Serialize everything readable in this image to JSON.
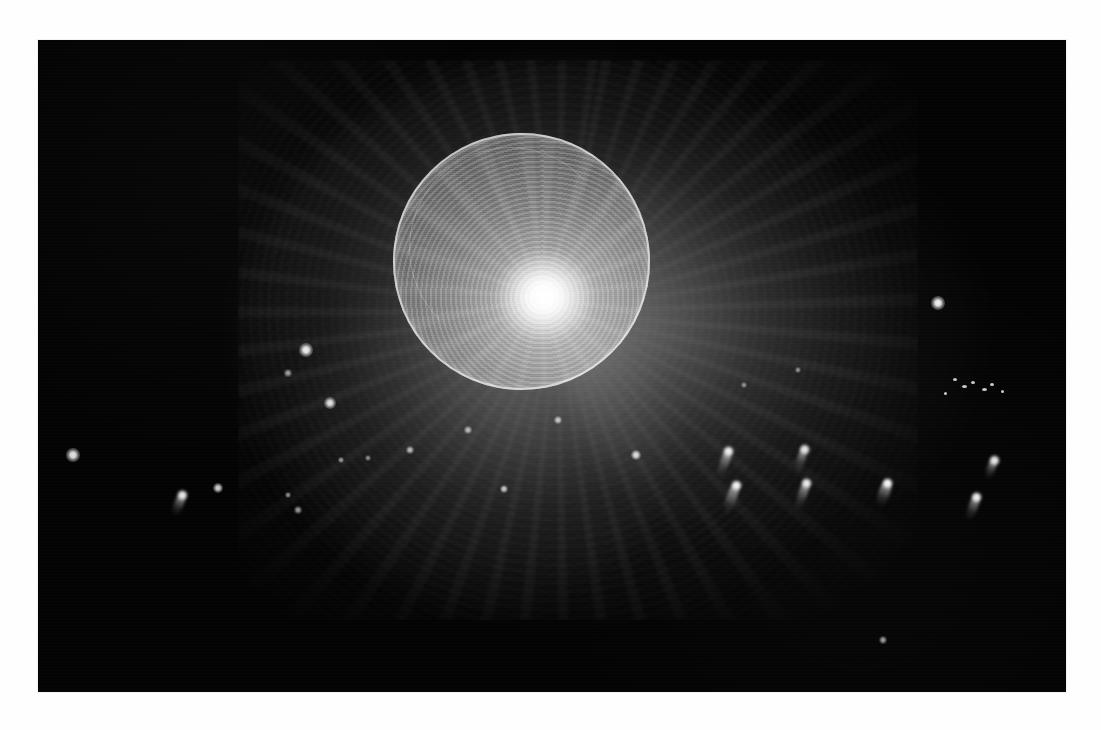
{
  "page": {
    "background_color": "#fefefe",
    "plate_background_color": "#030303",
    "caption": ""
  },
  "figure": {
    "title": "",
    "type": "grayscale-astronomical-plate",
    "plate": {
      "x": 38,
      "y": 40,
      "width": 1028,
      "height": 652
    }
  },
  "chart_data": {
    "type": "scatter",
    "title": "",
    "xlabel": "",
    "ylabel": "",
    "grid": false,
    "legend": "none",
    "xlim": [
      0,
      1028
    ],
    "ylim": [
      0,
      652
    ],
    "colors": {
      "background": "#030303",
      "source": "#ffffff",
      "halo": "#8c8c8c",
      "page": "#fefefe"
    },
    "sphere": {
      "center_x": 483,
      "center_y": 220,
      "radius": 128,
      "core_x": 467,
      "core_y": 218,
      "ring_count": 26,
      "peak_brightness": 255
    },
    "halo": {
      "center_x": 500,
      "center_y": 230,
      "radius_x": 330,
      "radius_y": 280,
      "mean_brightness": 58
    },
    "point_sources": [
      {
        "x": 35,
        "y": 415,
        "r": 3.0,
        "brightness": 230
      },
      {
        "x": 268,
        "y": 310,
        "r": 3.2,
        "brightness": 240
      },
      {
        "x": 250,
        "y": 333,
        "r": 1.6,
        "brightness": 150
      },
      {
        "x": 292,
        "y": 363,
        "r": 2.8,
        "brightness": 225
      },
      {
        "x": 180,
        "y": 448,
        "r": 2.2,
        "brightness": 210
      },
      {
        "x": 900,
        "y": 263,
        "r": 3.4,
        "brightness": 245
      },
      {
        "x": 303,
        "y": 420,
        "r": 1.5,
        "brightness": 140
      },
      {
        "x": 260,
        "y": 470,
        "r": 1.6,
        "brightness": 145
      },
      {
        "x": 520,
        "y": 380,
        "r": 1.8,
        "brightness": 175
      },
      {
        "x": 430,
        "y": 390,
        "r": 1.6,
        "brightness": 165
      },
      {
        "x": 372,
        "y": 410,
        "r": 1.7,
        "brightness": 170
      },
      {
        "x": 598,
        "y": 415,
        "r": 2.4,
        "brightness": 215
      },
      {
        "x": 466,
        "y": 449,
        "r": 1.9,
        "brightness": 185
      },
      {
        "x": 250,
        "y": 455,
        "r": 1.5,
        "brightness": 135
      },
      {
        "x": 330,
        "y": 418,
        "r": 1.4,
        "brightness": 130
      },
      {
        "x": 845,
        "y": 600,
        "r": 1.8,
        "brightness": 150
      },
      {
        "x": 760,
        "y": 330,
        "r": 1.5,
        "brightness": 130
      },
      {
        "x": 706,
        "y": 345,
        "r": 1.4,
        "brightness": 125
      }
    ],
    "speck_cluster": [
      {
        "x": 915,
        "y": 338,
        "w": 4,
        "h": 3
      },
      {
        "x": 924,
        "y": 345,
        "w": 5,
        "h": 3
      },
      {
        "x": 933,
        "y": 341,
        "w": 4,
        "h": 3
      },
      {
        "x": 944,
        "y": 348,
        "w": 5,
        "h": 3
      },
      {
        "x": 952,
        "y": 343,
        "w": 4,
        "h": 3
      },
      {
        "x": 906,
        "y": 352,
        "w": 3,
        "h": 3
      },
      {
        "x": 963,
        "y": 350,
        "w": 3,
        "h": 3
      }
    ],
    "elongated_objects": [
      {
        "x": 146,
        "y": 450,
        "length": 28,
        "width": 9,
        "angle": 22,
        "brightness": 235
      },
      {
        "x": 692,
        "y": 406,
        "length": 34,
        "width": 9,
        "angle": 20,
        "brightness": 240
      },
      {
        "x": 768,
        "y": 404,
        "length": 30,
        "width": 8,
        "angle": 18,
        "brightness": 230
      },
      {
        "x": 700,
        "y": 440,
        "length": 36,
        "width": 10,
        "angle": 20,
        "brightness": 245
      },
      {
        "x": 770,
        "y": 438,
        "length": 34,
        "width": 9,
        "angle": 20,
        "brightness": 238
      },
      {
        "x": 851,
        "y": 438,
        "length": 30,
        "width": 11,
        "angle": 20,
        "brightness": 250
      },
      {
        "x": 958,
        "y": 415,
        "length": 26,
        "width": 8,
        "angle": 20,
        "brightness": 235
      },
      {
        "x": 940,
        "y": 452,
        "length": 30,
        "width": 9,
        "angle": 20,
        "brightness": 240
      }
    ]
  }
}
